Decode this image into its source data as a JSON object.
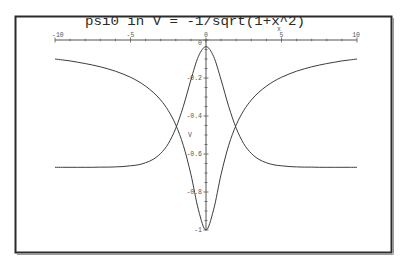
{
  "chart_data": {
    "type": "line",
    "title": "psi0 in V = -1/sqrt(1+x^2)",
    "xlabel": "x",
    "ylabel": "V",
    "xlim": [
      -10,
      10
    ],
    "ylim": [
      -1,
      0
    ],
    "grid": false,
    "legend": null,
    "x_axis_position": "top (y = 0)",
    "x_ticks": [
      -10,
      -5,
      0,
      5,
      10
    ],
    "x_tick_labels": [
      "-10",
      "-5",
      "0",
      "5",
      "10"
    ],
    "x_minor_step": 1,
    "y_ticks": [
      0,
      -0.2,
      -0.4,
      -0.6,
      -0.8,
      -1
    ],
    "y_tick_labels": [
      "0",
      "-0.2",
      "-0.4",
      "-0.6",
      "-0.8",
      "-1"
    ],
    "y_minor_step": 0.05,
    "x": [
      -10,
      -9.5,
      -9,
      -8.5,
      -8,
      -7.5,
      -7,
      -6.5,
      -6,
      -5.5,
      -5,
      -4.5,
      -4,
      -3.5,
      -3,
      -2.5,
      -2,
      -1.5,
      -1,
      -0.5,
      0,
      0.5,
      1,
      1.5,
      2,
      2.5,
      3,
      3.5,
      4,
      4.5,
      5,
      5.5,
      6,
      6.5,
      7,
      7.5,
      8,
      8.5,
      9,
      9.5,
      10
    ],
    "series": [
      {
        "name": "V",
        "values": [
          -0.1,
          -0.105,
          -0.11,
          -0.117,
          -0.124,
          -0.132,
          -0.141,
          -0.152,
          -0.164,
          -0.179,
          -0.196,
          -0.217,
          -0.243,
          -0.275,
          -0.316,
          -0.371,
          -0.447,
          -0.555,
          -0.707,
          -0.894,
          -1.0,
          -0.894,
          -0.707,
          -0.555,
          -0.447,
          -0.371,
          -0.316,
          -0.275,
          -0.243,
          -0.217,
          -0.196,
          -0.179,
          -0.164,
          -0.152,
          -0.141,
          -0.132,
          -0.124,
          -0.117,
          -0.11,
          -0.105,
          -0.1
        ]
      },
      {
        "name": "psi0",
        "values": [
          -0.67,
          -0.67,
          -0.67,
          -0.67,
          -0.67,
          -0.67,
          -0.669,
          -0.669,
          -0.668,
          -0.666,
          -0.662,
          -0.657,
          -0.646,
          -0.628,
          -0.597,
          -0.546,
          -0.464,
          -0.349,
          -0.21,
          -0.086,
          -0.035,
          -0.086,
          -0.21,
          -0.349,
          -0.464,
          -0.546,
          -0.597,
          -0.628,
          -0.646,
          -0.657,
          -0.662,
          -0.666,
          -0.668,
          -0.669,
          -0.669,
          -0.67,
          -0.67,
          -0.67,
          -0.67,
          -0.67,
          -0.67
        ]
      }
    ]
  },
  "colors": {
    "background": "#ffffff",
    "frame": "#2b2b2b",
    "axis": "#555555",
    "curve": "#3c3c3c",
    "title": "#2a2a2a"
  }
}
